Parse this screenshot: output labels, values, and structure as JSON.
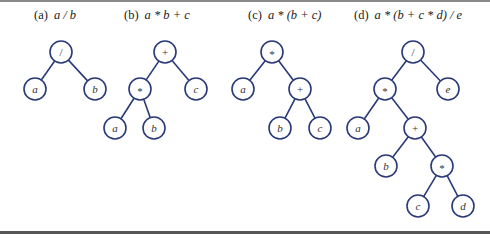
{
  "figure": {
    "panels": [
      {
        "id": "a",
        "label": "(a)",
        "expression": "a / b",
        "caption_x": 34,
        "nodes": [
          {
            "id": "root",
            "text": "/",
            "x": 61,
            "y": 52,
            "op": true
          },
          {
            "id": "a",
            "text": "a",
            "x": 35,
            "y": 89,
            "op": false
          },
          {
            "id": "b",
            "text": "b",
            "x": 95,
            "y": 89,
            "op": false
          }
        ],
        "edges": [
          [
            "root",
            "a"
          ],
          [
            "root",
            "b"
          ]
        ]
      },
      {
        "id": "b",
        "label": "(b)",
        "expression": "a * b + c",
        "caption_x": 124,
        "nodes": [
          {
            "id": "plus",
            "text": "+",
            "x": 165,
            "y": 52,
            "op": true
          },
          {
            "id": "mul",
            "text": "*",
            "x": 140,
            "y": 89,
            "op": true
          },
          {
            "id": "c",
            "text": "c",
            "x": 196,
            "y": 89,
            "op": false
          },
          {
            "id": "a",
            "text": "a",
            "x": 115,
            "y": 128,
            "op": false
          },
          {
            "id": "b",
            "text": "b",
            "x": 154,
            "y": 128,
            "op": false
          }
        ],
        "edges": [
          [
            "plus",
            "mul"
          ],
          [
            "plus",
            "c"
          ],
          [
            "mul",
            "a"
          ],
          [
            "mul",
            "b"
          ]
        ]
      },
      {
        "id": "c",
        "label": "(c)",
        "expression": "a * (b + c)",
        "caption_x": 248,
        "nodes": [
          {
            "id": "mul",
            "text": "*",
            "x": 272,
            "y": 52,
            "op": true
          },
          {
            "id": "a",
            "text": "a",
            "x": 243,
            "y": 89,
            "op": false
          },
          {
            "id": "plus",
            "text": "+",
            "x": 300,
            "y": 89,
            "op": true
          },
          {
            "id": "b",
            "text": "b",
            "x": 280,
            "y": 128,
            "op": false
          },
          {
            "id": "c",
            "text": "c",
            "x": 320,
            "y": 128,
            "op": false
          }
        ],
        "edges": [
          [
            "mul",
            "a"
          ],
          [
            "mul",
            "plus"
          ],
          [
            "plus",
            "b"
          ],
          [
            "plus",
            "c"
          ]
        ]
      },
      {
        "id": "d",
        "label": "(d)",
        "expression": "a * (b + c * d) / e",
        "caption_x": 354,
        "nodes": [
          {
            "id": "div",
            "text": "/",
            "x": 413,
            "y": 52,
            "op": true
          },
          {
            "id": "mul1",
            "text": "*",
            "x": 385,
            "y": 89,
            "op": true
          },
          {
            "id": "e",
            "text": "e",
            "x": 448,
            "y": 89,
            "op": false
          },
          {
            "id": "a",
            "text": "a",
            "x": 358,
            "y": 128,
            "op": false
          },
          {
            "id": "plus",
            "text": "+",
            "x": 415,
            "y": 128,
            "op": true
          },
          {
            "id": "b",
            "text": "b",
            "x": 386,
            "y": 166,
            "op": false
          },
          {
            "id": "mul2",
            "text": "*",
            "x": 442,
            "y": 166,
            "op": true
          },
          {
            "id": "c",
            "text": "c",
            "x": 418,
            "y": 206,
            "op": false
          },
          {
            "id": "d",
            "text": "d",
            "x": 463,
            "y": 206,
            "op": false
          }
        ],
        "edges": [
          [
            "div",
            "mul1"
          ],
          [
            "div",
            "e"
          ],
          [
            "mul1",
            "a"
          ],
          [
            "mul1",
            "plus"
          ],
          [
            "plus",
            "b"
          ],
          [
            "plus",
            "mul2"
          ],
          [
            "mul2",
            "c"
          ],
          [
            "mul2",
            "d"
          ]
        ]
      }
    ],
    "style": {
      "node_radius": 11,
      "stroke_color": "#2a3a78"
    }
  }
}
